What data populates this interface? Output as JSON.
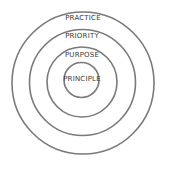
{
  "diagram": {
    "type": "concentric-circles",
    "colors": {
      "stroke": "#7a7a7a",
      "text": "#3a3a3a",
      "background": "#ffffff"
    },
    "rings": [
      {
        "label": "PRACTICE",
        "level": "outer"
      },
      {
        "label": "PRIORITY",
        "level": "second"
      },
      {
        "label": "PURPOSE",
        "level": "third"
      },
      {
        "label": "PRINCIPLE",
        "level": "core"
      }
    ]
  }
}
